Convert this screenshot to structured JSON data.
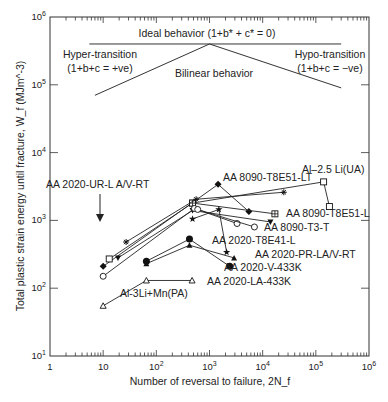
{
  "chart_data": {
    "type": "line",
    "xscale": "log",
    "yscale": "log",
    "xlabel": "Number of reversal to failure, 2N_f",
    "ylabel": "Total plastic strain energy until fracture, W_f (MJm^-3)",
    "xlim": [
      1,
      1000000
    ],
    "ylim": [
      10,
      1000000
    ],
    "x_ticks": [
      "1",
      "10",
      "10^2",
      "10^3",
      "10^4",
      "10^5",
      "10^6"
    ],
    "y_ticks": [
      "10^1",
      "10^2",
      "10^3",
      "10^4",
      "10^5",
      "10^6"
    ],
    "grid": false,
    "annotations": {
      "ideal": "Ideal behavior (1+b* + c* = 0)",
      "hyper_title": "Hyper-transition",
      "hyper_eq": "(1+b+c = +ve)",
      "hypo_title": "Hypo-transition",
      "hypo_eq": "(1+b+c = −ve)",
      "bilinear": "Bilinear behavior",
      "ur_arrow_label": "AA 2020-UR-L A/V-RT"
    },
    "schematic": {
      "ideal_line": [
        [
          5.5,
          400000
        ],
        [
          300000,
          400000
        ]
      ],
      "bilinear_left": [
        [
          7,
          70000
        ],
        [
          1000,
          400000
        ]
      ],
      "bilinear_right": [
        [
          1000,
          400000
        ],
        [
          300000,
          90000
        ]
      ]
    },
    "series": [
      {
        "name": "AA 8090-T8E51-LT",
        "marker": "filled-diamond",
        "points": [
          [
            10,
            210
          ],
          [
            1450,
            3400
          ],
          [
            5500,
            1350
          ]
        ]
      },
      {
        "name": "Al–2.5 Li(UA)",
        "marker": "open-square",
        "points": [
          [
            13,
            270
          ],
          [
            480,
            1800
          ],
          [
            140000,
            3700
          ],
          [
            180000,
            1600
          ]
        ]
      },
      {
        "name": "AA 8090-T8E51-L",
        "marker": "crossed-square",
        "points": [
          [
            480,
            1800
          ],
          [
            17000,
            1250
          ]
        ]
      },
      {
        "name": "AA 8090-T3-T",
        "marker": "filled-tri-down",
        "points": [
          [
            19,
            280
          ],
          [
            480,
            1400
          ],
          [
            14000,
            950
          ]
        ]
      },
      {
        "name": "AA 8090-T3-T (open circle)",
        "marker": "open-circle",
        "points": [
          [
            10,
            150
          ],
          [
            520,
            1500
          ],
          [
            3300,
            900
          ]
        ]
      },
      {
        "name": "AA 2020-T8E41-L",
        "marker": "open-circle-line",
        "points": [
          [
            600,
            1450
          ],
          [
            7000,
            800
          ]
        ]
      },
      {
        "name": "AA 2020-UR-L A/V-RT",
        "marker": "star",
        "points": [
          [
            27,
            480
          ],
          [
            560,
            2050
          ],
          [
            25000,
            2600
          ]
        ]
      },
      {
        "name": "AA 2020-PR-LA/V-RT",
        "marker": "filled-star",
        "points": [
          [
            480,
            1050
          ],
          [
            1500,
            1450
          ],
          [
            2100,
            340
          ]
        ]
      },
      {
        "name": "AA 2020-V-433K",
        "marker": "filled-tri-up",
        "points": [
          [
            65,
            230
          ],
          [
            420,
            430
          ],
          [
            2900,
            280
          ]
        ]
      },
      {
        "name": "AA 2020-LA-433K",
        "marker": "filled-circle",
        "points": [
          [
            65,
            250
          ],
          [
            420,
            530
          ],
          [
            2400,
            210
          ]
        ]
      },
      {
        "name": "Al-3Li+Mn(PA)",
        "marker": "open-tri-up",
        "points": [
          [
            10,
            55
          ],
          [
            65,
            130
          ],
          [
            470,
            130
          ]
        ]
      }
    ],
    "labels": [
      {
        "text": "AA 8090-T8E51-LT",
        "x": 223,
        "y": 181
      },
      {
        "text": "Al–2.5 Li(UA)",
        "x": 302,
        "y": 173
      },
      {
        "text": "AA 8090-T8E51-L",
        "x": 286,
        "y": 217
      },
      {
        "text": "AA 8090-T3-T",
        "x": 264,
        "y": 231
      },
      {
        "text": "AA 2020-T8E41-L",
        "x": 212,
        "y": 244
      },
      {
        "text": "AA 2020-PR-LA/V-RT",
        "x": 255,
        "y": 258
      },
      {
        "text": "AA 2020-V-433K",
        "x": 224,
        "y": 271
      },
      {
        "text": "AA 2020-LA-433K",
        "x": 207,
        "y": 285
      },
      {
        "text": "Al-3Li+Mn(PA)",
        "x": 120,
        "y": 297
      }
    ]
  }
}
